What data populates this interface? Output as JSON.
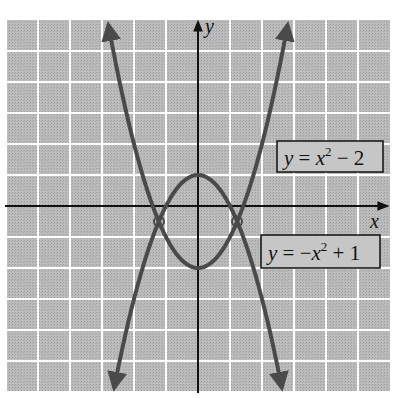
{
  "chart_data": {
    "type": "line",
    "title": "",
    "xlabel": "x",
    "ylabel": "y",
    "xlim": [
      -6,
      6
    ],
    "ylim": [
      -6,
      6
    ],
    "grid": true,
    "series": [
      {
        "name": "y = x^2 - 2",
        "expr": "x^2-2",
        "label_text": "y = x² − 2",
        "color": "#4a4a4a"
      },
      {
        "name": "y = -x^2 + 1",
        "expr": "-x^2+1",
        "label_text": "y = −x² + 1",
        "color": "#4a4a4a"
      }
    ],
    "intersections": [
      {
        "x": -1.2247,
        "y": -0.5
      },
      {
        "x": 1.2247,
        "y": -0.5
      }
    ],
    "annotations": [
      {
        "text": "y = x² − 2",
        "boxed": true,
        "position": "right, above x-axis"
      },
      {
        "text": "y = −x² + 1",
        "boxed": true,
        "position": "right, below x-axis"
      }
    ]
  },
  "axes": {
    "x_label": "x",
    "y_label": "y"
  },
  "labels": {
    "upper_box": {
      "y": "y",
      "eq": " = ",
      "x": "x",
      "sup": "2",
      "rest": " − 2"
    },
    "lower_box": {
      "y": "y",
      "eq": " = −",
      "x": "x",
      "sup": "2",
      "rest": " + 1"
    }
  },
  "colors": {
    "grid_bg": "#b4b4b4",
    "grid_line": "#ffffff",
    "curve": "#4a4a4a",
    "axis": "#111111"
  }
}
